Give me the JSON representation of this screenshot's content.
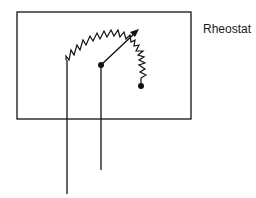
{
  "diagram": {
    "title": "Rheostat",
    "components": [
      {
        "type": "enclosure-box",
        "description": "rectangular housing"
      },
      {
        "type": "resistor-arc",
        "description": "zigzag resistive element curved in an arc"
      },
      {
        "type": "wiper-arrow",
        "description": "adjustable contact arrow pivoting from center terminal"
      },
      {
        "type": "terminal-dot",
        "description": "center pivot terminal"
      },
      {
        "type": "terminal-dot",
        "description": "end of resistor terminal"
      },
      {
        "type": "lead-wire",
        "description": "left lead from resistor start, extends below box"
      },
      {
        "type": "lead-wire",
        "description": "center lead from wiper pivot, extends below box"
      }
    ],
    "colors": {
      "stroke": "#111111",
      "background": "#ffffff"
    }
  }
}
